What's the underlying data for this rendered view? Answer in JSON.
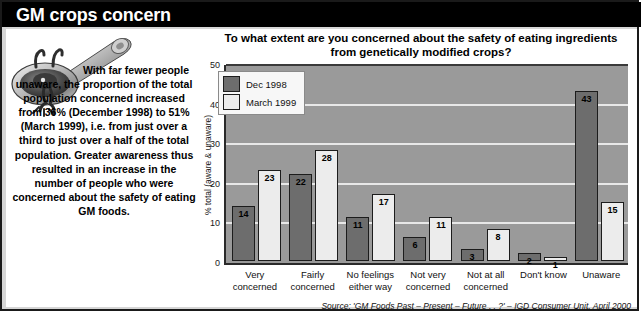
{
  "header": {
    "title": "GM crops concern"
  },
  "article": {
    "body": "With far fewer people unaware, the proportion of the total population concerned increased from 36% (December 1998) to 51% (March 1999), i.e. from just over a third to just over a half of the total population. Greater awareness thus resulted in an increase in the number of people who were concerned about the safety of eating GM foods.",
    "illustration_name": "spoon-with-creature-illustration"
  },
  "chart_data": {
    "type": "bar",
    "title": "To what extent are you concerned about the safety of eating ingredients from genetically modified crops?",
    "xlabel": "",
    "ylabel": "% total (aware & unaware)",
    "ylim": [
      0,
      50
    ],
    "yticks": [
      0,
      10,
      20,
      30,
      40,
      50
    ],
    "grid": true,
    "legend_position": "top-left",
    "categories": [
      "Very concerned",
      "Fairly concerned",
      "No feelings either way",
      "Not very concerned",
      "Not at all concerned",
      "Don't know",
      "Unaware"
    ],
    "category_lines": [
      [
        "Very",
        "concerned"
      ],
      [
        "Fairly",
        "concerned"
      ],
      [
        "No feelings",
        "either way"
      ],
      [
        "Not very",
        "concerned"
      ],
      [
        "Not at all",
        "concerned"
      ],
      [
        "Don't know",
        ""
      ],
      [
        "Unaware",
        ""
      ]
    ],
    "series": [
      {
        "name": "Dec 1998",
        "color": "#6d6d6d",
        "values": [
          14,
          22,
          11,
          6,
          3,
          2,
          43
        ]
      },
      {
        "name": "March 1999",
        "color": "#ececec",
        "values": [
          23,
          28,
          17,
          11,
          8,
          1,
          15
        ]
      }
    ],
    "source": "Source: 'GM Foods Past – Present – Future . . ?' – IGD Consumer Unit, April 2000"
  }
}
